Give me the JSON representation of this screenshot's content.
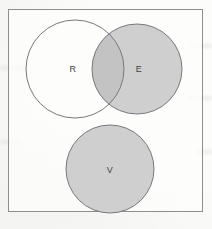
{
  "figure": {
    "type": "venn-diagram",
    "background_color": "#fcfcfb",
    "frame": {
      "border_color": "#8c8e90",
      "x": 8,
      "y": 9,
      "width": 195,
      "height": 203
    },
    "fill_color": "#cfcfcf",
    "overlap_fill_color": "#c3c3c3",
    "stroke_color": "#76797c",
    "label_color": "#3f4144",
    "sets": [
      {
        "id": "R",
        "label": "R",
        "cx": 75,
        "cy": 69,
        "r": 49,
        "filled": false,
        "label_x": 73,
        "label_y": 69
      },
      {
        "id": "E",
        "label": "E",
        "cx": 137,
        "cy": 69,
        "r": 45,
        "filled": true,
        "label_x": 139,
        "label_y": 69
      },
      {
        "id": "V",
        "label": "V",
        "cx": 110,
        "cy": 169,
        "r": 44,
        "filled": true,
        "label_x": 110,
        "label_y": 170
      }
    ],
    "overlaps": [
      {
        "sets": [
          "R",
          "E"
        ],
        "shaded": true
      }
    ]
  },
  "caption": {
    "text": "",
    "visible": false
  }
}
